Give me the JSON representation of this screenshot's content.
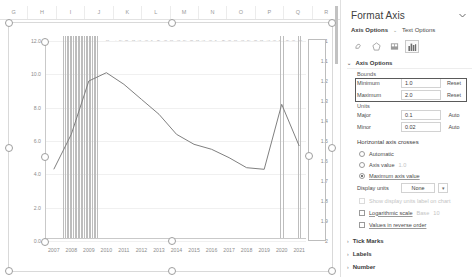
{
  "worksheet": {
    "column_headers": [
      "G",
      "H",
      "I",
      "J",
      "K",
      "L",
      "M",
      "N",
      "O",
      "P",
      "Q",
      "R"
    ]
  },
  "chart_data": {
    "type": "line",
    "title": "",
    "xlabel": "",
    "ylabel": "",
    "x": [
      2007,
      2008,
      2009,
      2010,
      2011,
      2012,
      2013,
      2014,
      2015,
      2016,
      2017,
      2018,
      2019,
      2020,
      2021
    ],
    "series": [
      {
        "name": "line-series",
        "axis": "primary",
        "values": [
          4.3,
          6.4,
          9.6,
          10.1,
          9.4,
          8.5,
          7.6,
          6.4,
          5.8,
          5.5,
          5.0,
          4.4,
          4.3,
          8.2,
          5.7
        ]
      },
      {
        "name": "bar-series",
        "axis": "primary",
        "values": [
          0,
          12.2,
          12.2,
          0,
          0,
          0,
          0,
          0,
          0,
          0,
          0,
          0,
          0,
          12.2,
          12.2
        ]
      }
    ],
    "ylim": [
      0,
      12.0
    ],
    "y_ticks": [
      "0.0",
      "2.0",
      "4.0",
      "6.0",
      "8.0",
      "10.0",
      "12.0"
    ],
    "secondary_ylim": [
      1,
      2
    ],
    "secondary_y_ticks": [
      "1",
      "1.1",
      "1.2",
      "1.3",
      "1.4",
      "1.5",
      "1.6",
      "1.7",
      "1.8",
      "1.9",
      "2"
    ],
    "x_ticks": [
      "2007",
      "2008",
      "2009",
      "2010",
      "2011",
      "2012",
      "2013",
      "2014",
      "2015",
      "2016",
      "2017",
      "2018",
      "2019",
      "2020",
      "2021"
    ],
    "grid": true,
    "legend": "none",
    "data_labels_row": "1 1 2 3 4 5 6 7 8 9 10 11 12 13 14 15 16 17 18 19 20 21 22 23 24 25 26 27 28 29 30 31 32 33 34 35 36 37 38 39 40"
  },
  "pane": {
    "title": "Format Axis",
    "collapse_icon": "chevron-down-icon",
    "tabs": [
      {
        "label": "Axis Options",
        "active": true
      },
      {
        "label": "Text Options",
        "active": false
      }
    ],
    "icon_tabs": [
      {
        "name": "fill-line-icon",
        "glyph": "◔",
        "active": false
      },
      {
        "name": "effects-icon",
        "glyph": "⬠",
        "active": false
      },
      {
        "name": "size-properties-icon",
        "glyph": "▦",
        "active": false
      },
      {
        "name": "axis-options-icon",
        "glyph": "▥",
        "active": true
      }
    ],
    "section": {
      "header": "Axis Options",
      "bounds_label": "Bounds",
      "bounds": [
        {
          "label": "Minimum",
          "value": "1.0",
          "button": "Reset"
        },
        {
          "label": "Maximum",
          "value": "2.0",
          "button": "Reset"
        }
      ],
      "units_label": "Units",
      "units": [
        {
          "label": "Major",
          "value": "0.1",
          "button": "Auto"
        },
        {
          "label": "Minor",
          "value": "0.02",
          "button": "Auto"
        }
      ],
      "crosses_label": "Horizontal axis crosses",
      "crosses_options": [
        {
          "label": "Automatic",
          "selected": false,
          "value": ""
        },
        {
          "label": "Axis value",
          "selected": false,
          "value": "1.0"
        },
        {
          "label": "Maximum axis value",
          "selected": true,
          "value": ""
        }
      ],
      "display_units_label": "Display units",
      "display_units_value": "None",
      "show_display_units_label": "Show display units label on chart",
      "logarithmic_label": "Logarithmic scale",
      "logarithmic_base_label": "Base",
      "logarithmic_base_value": "10",
      "reverse_label": "Values in reverse order"
    },
    "collapsed_sections": [
      "Tick Marks",
      "Labels",
      "Number"
    ]
  }
}
